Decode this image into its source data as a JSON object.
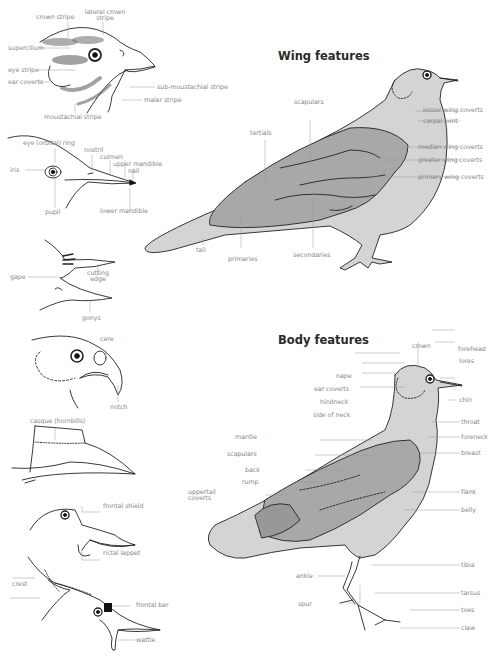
{
  "colors": {
    "body_fill": "#d4d4d4",
    "wing_fill": "#a8a8a8",
    "wing_dark": "#989898",
    "outline": "#222222",
    "leader": "#9a9a9a",
    "label_text": "#8a8a8a",
    "title_text": "#2a2a2a"
  },
  "sections": {
    "wing": {
      "title": "Wing features"
    },
    "body": {
      "title": "Body features"
    }
  },
  "head_details": {
    "passerine_head": {
      "labels": [
        "crown stripe",
        "lateral crown stripe",
        "supercilium",
        "eye stripe",
        "ear coverts",
        "sub-moustachial stripe",
        "malar stripe",
        "moustachial stripe"
      ]
    },
    "eye_bill_head": {
      "labels": [
        "eye (orbital) ring",
        "nostril",
        "culmen",
        "upper mandible",
        "nail",
        "iris",
        "pupil",
        "lower mandible"
      ]
    },
    "open_bill": {
      "labels": [
        "gape",
        "cutting edge",
        "gonys"
      ]
    },
    "raptor_head": {
      "labels": [
        "cere",
        "notch"
      ]
    },
    "hornbill_bill": {
      "labels": [
        "casque (hornbills)"
      ]
    },
    "shield_head": {
      "labels": [
        "frontal shield",
        "rictal lappet"
      ]
    },
    "crested_head": {
      "labels": [
        "crest",
        "frontal bar",
        "wattle"
      ]
    }
  },
  "wing_labels": {
    "left": [
      "scapulars",
      "tertials",
      "tail",
      "primaries",
      "secondaries"
    ],
    "right": [
      "lesser wing coverts",
      "carpal joint",
      "median wing coverts",
      "greater wing coverts",
      "primary wing coverts"
    ]
  },
  "body_labels": {
    "top": [
      "crown"
    ],
    "left": [
      "nape",
      "ear coverts",
      "hindneck",
      "side of neck",
      "mantle",
      "scapulars",
      "back",
      "rump",
      "uppertail coverts",
      "ankle",
      "spur"
    ],
    "right": [
      "forehead",
      "lores",
      "chin",
      "throat",
      "foreneck",
      "breast",
      "flank",
      "belly",
      "tibia",
      "tarsus",
      "toes",
      "claw"
    ]
  }
}
